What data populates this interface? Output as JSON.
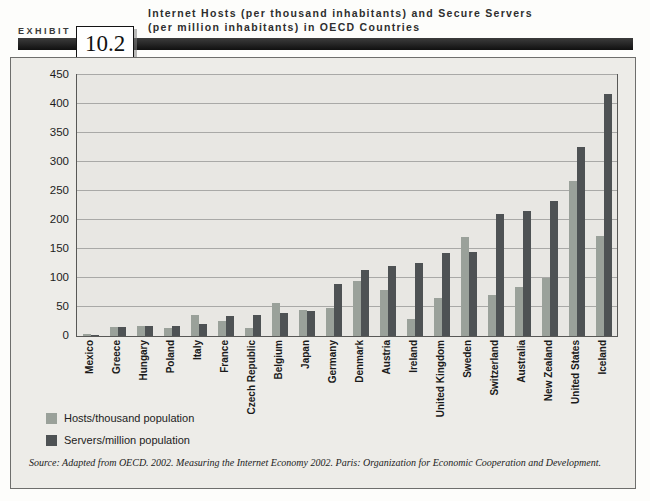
{
  "exhibit": {
    "label": "EXHIBIT",
    "number": "10.2"
  },
  "title_line1": "Internet Hosts (per thousand inhabitants) and Secure Servers",
  "title_line2": "(per million inhabitants) in OECD Countries",
  "source": "Source:  Adapted from OECD. 2002. Measuring the Internet Economy 2002. Paris: Organization for Economic Cooperation and Development.",
  "colors": {
    "hosts_bar": "#9aa19a",
    "servers_bar": "#4e5254",
    "plot_background": "#e8e7e3",
    "panel_background": "#edece8",
    "gridline": "#a9a9a7",
    "banner": "#1a1a1a"
  },
  "legend": [
    {
      "label": "Hosts/thousand population",
      "color": "#9aa19a"
    },
    {
      "label": "Servers/million population",
      "color": "#4e5254"
    }
  ],
  "chart_data": {
    "type": "bar",
    "title": "Internet Hosts (per thousand inhabitants) and Secure Servers (per million inhabitants) in OECD Countries",
    "categories": [
      "Mexico",
      "Greece",
      "Hungary",
      "Poland",
      "Italy",
      "France",
      "Czech Republic",
      "Belgium",
      "Japan",
      "Germany",
      "Denmark",
      "Austria",
      "Ireland",
      "United Kingdom",
      "Sweden",
      "Switzerland",
      "Australia",
      "New Zealand",
      "United States",
      "Iceland"
    ],
    "series": [
      {
        "name": "Hosts/thousand population",
        "color": "#9aa19a",
        "values": [
          3,
          15,
          17,
          13,
          37,
          26,
          14,
          57,
          45,
          48,
          95,
          80,
          30,
          65,
          170,
          70,
          84,
          100,
          267,
          172
        ]
      },
      {
        "name": "Servers/million population",
        "color": "#4e5254",
        "values": [
          2,
          15,
          17,
          18,
          21,
          35,
          37,
          40,
          43,
          90,
          113,
          120,
          126,
          143,
          145,
          210,
          215,
          232,
          326,
          417
        ]
      }
    ],
    "xlabel": "",
    "ylabel": "",
    "ylim": [
      0,
      450
    ],
    "ytick_interval": 50,
    "grid": true,
    "legend_position": "bottom-left"
  }
}
